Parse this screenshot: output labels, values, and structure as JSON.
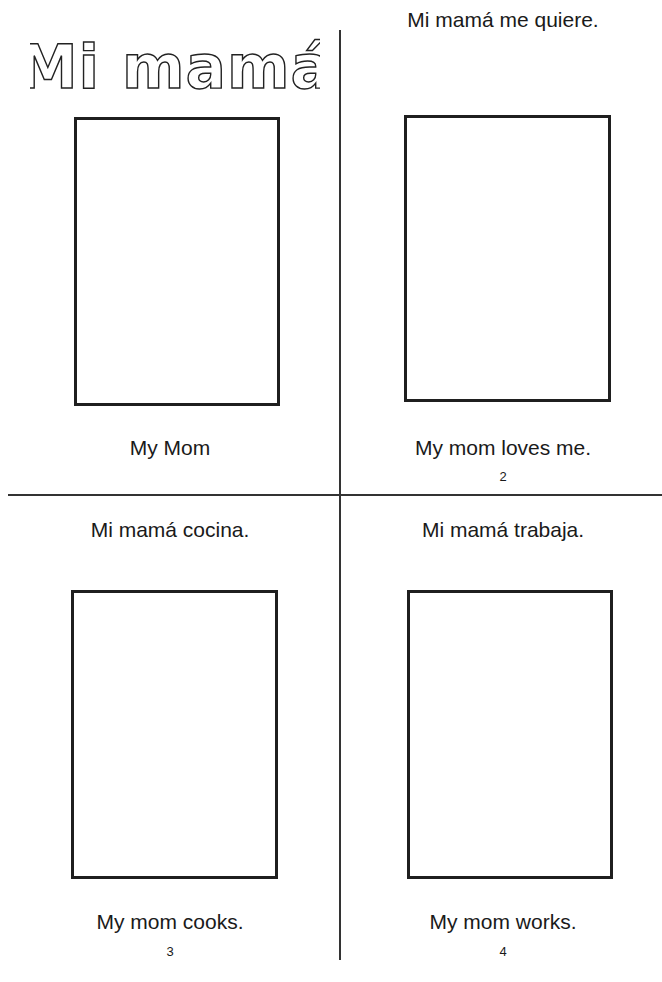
{
  "title": "Mi mamá",
  "pages": [
    {
      "heading": "",
      "caption": "My Mom",
      "page_number": ""
    },
    {
      "heading": "Mi mamá me quiere.",
      "caption": "My mom loves me.",
      "page_number": "2"
    },
    {
      "heading": "Mi mamá cocina.",
      "caption": "My mom cooks.",
      "page_number": "3"
    },
    {
      "heading": "Mi mamá trabaja.",
      "caption": "My mom works.",
      "page_number": "4"
    }
  ]
}
